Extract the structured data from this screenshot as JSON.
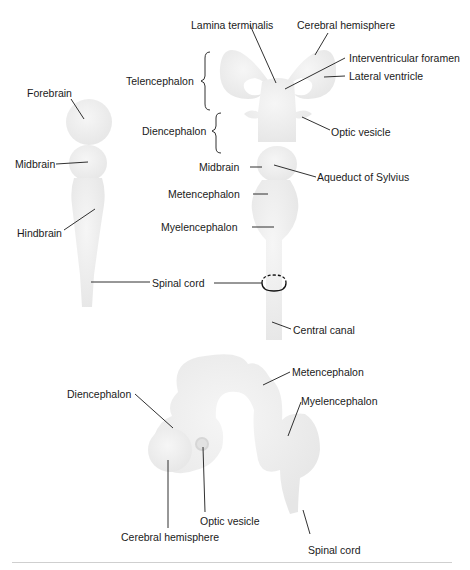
{
  "figure": {
    "fill_color": "#ececec",
    "fill_highlight": "#f7f7f7",
    "line_color": "#1a1a1a"
  },
  "diagrams": {
    "three_vesicle": {
      "labels": {
        "forebrain": "Forebrain",
        "midbrain": "Midbrain",
        "hindbrain": "Hindbrain",
        "spinal_cord": "Spinal cord"
      }
    },
    "five_vesicle": {
      "labels": {
        "lamina_terminalis": "Lamina terminalis",
        "cerebral_hemisphere": "Cerebral hemisphere",
        "interventricular_foramen": "Interventricular foramen",
        "lateral_ventricle": "Lateral ventricle",
        "telencephalon": "Telencephalon",
        "diencephalon": "Diencephalon",
        "optic_vesicle": "Optic vesicle",
        "midbrain": "Midbrain",
        "aqueduct": "Aqueduct of Sylvius",
        "metencephalon": "Metencephalon",
        "myelencephalon": "Myelencephalon",
        "central_canal": "Central canal"
      }
    },
    "lateral_view": {
      "labels": {
        "diencephalon": "Diencephalon",
        "metencephalon": "Metencephalon",
        "myelencephalon": "Myelencephalon",
        "optic_vesicle": "Optic vesicle",
        "cerebral_hemisphere": "Cerebral hemisphere",
        "spinal_cord": "Spinal cord"
      }
    }
  }
}
